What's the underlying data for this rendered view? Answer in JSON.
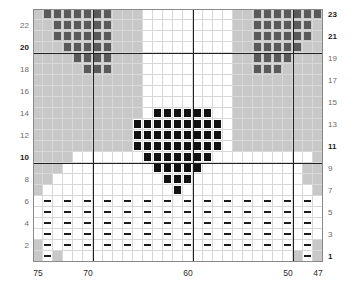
{
  "chart_data": {
    "type": "heatmap",
    "title": "",
    "xlabel": "",
    "ylabel": "",
    "grid": true,
    "columns": 29,
    "rows": 23,
    "x_tick_labels": [
      "75",
      "70",
      "60",
      "50",
      "47"
    ],
    "x_tick_columns": [
      0,
      5,
      15,
      25,
      28
    ],
    "x_range": [
      75,
      47
    ],
    "x_direction": "descending",
    "y_left_tick_labels": [
      "22",
      "20",
      "18",
      "16",
      "14",
      "12",
      "10",
      "8",
      "6",
      "4",
      "2"
    ],
    "y_right_tick_labels": [
      "23",
      "21",
      "19",
      "17",
      "15",
      "13",
      "11",
      "9",
      "7",
      "5",
      "3",
      "1"
    ],
    "y_range": [
      1,
      23
    ],
    "legend": [],
    "symbols": [
      {
        "key": "gray",
        "name": "dark-gray-square",
        "color": "#5a5a5a"
      },
      {
        "key": "black",
        "name": "black-square",
        "color": "#111111"
      },
      {
        "key": "dash",
        "name": "horizontal-dash",
        "color": "#1a1a1a"
      },
      {
        "key": "bg",
        "name": "shaded-background",
        "color": "#c8c8c8"
      },
      {
        "key": "white",
        "name": "empty-cell",
        "color": "#ffffff"
      }
    ],
    "emphasis_lines": {
      "vertical_columns": [
        5,
        15,
        25
      ],
      "horizontal_rows_from_top": [
        3,
        13
      ],
      "color": "#202020"
    },
    "matrix": [
      "bggggggg.bbb.................bbggggggg.b",
      "bggggggg.bbb.................bbggggggg.b",
      "bggggggg.bbb.................bbggggggg.b",
      "bbggggg..bbb.................bbggggggg.b"
    ],
    "cell_rows": [
      [
        "bg",
        "gray",
        "gray",
        "gray",
        "gray",
        "gray",
        "gray",
        "gray",
        "bg",
        "bg",
        "bg",
        "white",
        "white",
        "white",
        "white",
        "white",
        "white",
        "white",
        "white",
        "white",
        "bg",
        "bg",
        "gray",
        "gray",
        "gray",
        "gray",
        "gray",
        "gray",
        "gray"
      ],
      [
        "bg",
        "bg",
        "gray",
        "gray",
        "gray",
        "gray",
        "gray",
        "gray",
        "bg",
        "bg",
        "bg",
        "white",
        "white",
        "white",
        "white",
        "white",
        "white",
        "white",
        "white",
        "white",
        "bg",
        "bg",
        "gray",
        "gray",
        "gray",
        "gray",
        "gray",
        "gray",
        "bg"
      ],
      [
        "bg",
        "bg",
        "gray",
        "gray",
        "gray",
        "gray",
        "gray",
        "gray",
        "bg",
        "bg",
        "bg",
        "white",
        "white",
        "white",
        "white",
        "white",
        "white",
        "white",
        "white",
        "white",
        "bg",
        "bg",
        "gray",
        "gray",
        "gray",
        "gray",
        "gray",
        "gray",
        "bg"
      ],
      [
        "bg",
        "bg",
        "bg",
        "gray",
        "gray",
        "gray",
        "gray",
        "gray",
        "bg",
        "bg",
        "bg",
        "white",
        "white",
        "white",
        "white",
        "white",
        "white",
        "white",
        "white",
        "white",
        "bg",
        "bg",
        "gray",
        "gray",
        "gray",
        "gray",
        "gray",
        "bg",
        "bg"
      ],
      [
        "bg",
        "bg",
        "bg",
        "bg",
        "gray",
        "gray",
        "gray",
        "gray",
        "bg",
        "bg",
        "bg",
        "white",
        "white",
        "white",
        "white",
        "white",
        "white",
        "white",
        "white",
        "white",
        "bg",
        "bg",
        "gray",
        "gray",
        "gray",
        "gray",
        "bg",
        "bg",
        "bg"
      ],
      [
        "bg",
        "bg",
        "bg",
        "bg",
        "bg",
        "gray",
        "gray",
        "gray",
        "bg",
        "bg",
        "bg",
        "white",
        "white",
        "white",
        "white",
        "white",
        "white",
        "white",
        "white",
        "white",
        "bg",
        "bg",
        "gray",
        "gray",
        "gray",
        "bg",
        "bg",
        "bg",
        "bg"
      ],
      [
        "bg",
        "bg",
        "bg",
        "bg",
        "bg",
        "bg",
        "bg",
        "bg",
        "bg",
        "bg",
        "bg",
        "white",
        "white",
        "white",
        "white",
        "white",
        "white",
        "white",
        "white",
        "white",
        "bg",
        "bg",
        "bg",
        "bg",
        "bg",
        "bg",
        "bg",
        "bg",
        "bg"
      ],
      [
        "bg",
        "bg",
        "bg",
        "bg",
        "bg",
        "bg",
        "bg",
        "bg",
        "bg",
        "bg",
        "bg",
        "white",
        "white",
        "white",
        "white",
        "white",
        "white",
        "white",
        "white",
        "white",
        "bg",
        "bg",
        "bg",
        "bg",
        "bg",
        "bg",
        "bg",
        "bg",
        "bg"
      ],
      [
        "bg",
        "bg",
        "bg",
        "bg",
        "bg",
        "bg",
        "bg",
        "bg",
        "bg",
        "bg",
        "bg",
        "white",
        "white",
        "white",
        "white",
        "white",
        "white",
        "white",
        "white",
        "white",
        "bg",
        "bg",
        "bg",
        "bg",
        "bg",
        "bg",
        "bg",
        "bg",
        "bg"
      ],
      [
        "bg",
        "bg",
        "bg",
        "bg",
        "bg",
        "bg",
        "bg",
        "bg",
        "bg",
        "bg",
        "bg",
        "white",
        "black",
        "black",
        "black",
        "black",
        "black",
        "black",
        "white",
        "white",
        "bg",
        "bg",
        "bg",
        "bg",
        "bg",
        "bg",
        "bg",
        "bg",
        "bg"
      ],
      [
        "bg",
        "bg",
        "bg",
        "bg",
        "bg",
        "bg",
        "bg",
        "bg",
        "bg",
        "bg",
        "black",
        "black",
        "black",
        "black",
        "black",
        "black",
        "black",
        "black",
        "black",
        "white",
        "bg",
        "bg",
        "bg",
        "bg",
        "bg",
        "bg",
        "bg",
        "bg",
        "bg"
      ],
      [
        "bg",
        "bg",
        "bg",
        "bg",
        "bg",
        "bg",
        "bg",
        "bg",
        "bg",
        "bg",
        "black",
        "black",
        "black",
        "black",
        "black",
        "black",
        "black",
        "black",
        "black",
        "white",
        "bg",
        "bg",
        "bg",
        "bg",
        "bg",
        "bg",
        "bg",
        "bg",
        "bg"
      ],
      [
        "bg",
        "bg",
        "bg",
        "bg",
        "bg",
        "bg",
        "bg",
        "bg",
        "bg",
        "bg",
        "black",
        "black",
        "black",
        "black",
        "black",
        "black",
        "black",
        "black",
        "black",
        "white",
        "bg",
        "bg",
        "bg",
        "bg",
        "bg",
        "bg",
        "bg",
        "bg",
        "bg"
      ],
      [
        "bg",
        "bg",
        "bg",
        "bg",
        "white",
        "white",
        "white",
        "white",
        "white",
        "white",
        "white",
        "black",
        "black",
        "black",
        "black",
        "black",
        "black",
        "black",
        "white",
        "white",
        "white",
        "white",
        "white",
        "white",
        "white",
        "white",
        "white",
        "white",
        "bg"
      ],
      [
        "bg",
        "bg",
        "bg",
        "white",
        "white",
        "white",
        "white",
        "white",
        "white",
        "white",
        "white",
        "white",
        "black",
        "black",
        "black",
        "black",
        "black",
        "white",
        "white",
        "white",
        "white",
        "white",
        "white",
        "white",
        "white",
        "white",
        "white",
        "bg",
        "bg"
      ],
      [
        "bg",
        "bg",
        "white",
        "white",
        "white",
        "white",
        "white",
        "white",
        "white",
        "white",
        "white",
        "white",
        "white",
        "black",
        "black",
        "black",
        "white",
        "white",
        "white",
        "white",
        "white",
        "white",
        "white",
        "white",
        "white",
        "white",
        "white",
        "bg",
        "bg"
      ],
      [
        "bg",
        "white",
        "white",
        "white",
        "white",
        "white",
        "white",
        "white",
        "white",
        "white",
        "white",
        "white",
        "white",
        "white",
        "black",
        "white",
        "white",
        "white",
        "white",
        "white",
        "white",
        "white",
        "white",
        "white",
        "white",
        "white",
        "white",
        "white",
        "bg"
      ],
      [
        "white",
        "dash",
        "white",
        "dash",
        "white",
        "dash",
        "white",
        "dash",
        "white",
        "dash",
        "white",
        "dash",
        "white",
        "dash",
        "white",
        "dash",
        "white",
        "dash",
        "white",
        "dash",
        "white",
        "dash",
        "white",
        "dash",
        "white",
        "dash",
        "white",
        "dash",
        "white"
      ],
      [
        "white",
        "dash",
        "white",
        "dash",
        "white",
        "dash",
        "white",
        "dash",
        "white",
        "dash",
        "white",
        "dash",
        "white",
        "dash",
        "white",
        "dash",
        "white",
        "dash",
        "white",
        "dash",
        "white",
        "dash",
        "white",
        "dash",
        "white",
        "dash",
        "white",
        "dash",
        "white"
      ],
      [
        "white",
        "dash",
        "white",
        "dash",
        "white",
        "dash",
        "white",
        "dash",
        "white",
        "dash",
        "white",
        "dash",
        "white",
        "dash",
        "white",
        "dash",
        "white",
        "dash",
        "white",
        "dash",
        "white",
        "dash",
        "white",
        "dash",
        "white",
        "dash",
        "white",
        "dash",
        "white"
      ],
      [
        "white",
        "dash",
        "white",
        "dash",
        "white",
        "dash",
        "white",
        "dash",
        "white",
        "dash",
        "white",
        "dash",
        "white",
        "dash",
        "white",
        "dash",
        "white",
        "dash",
        "white",
        "dash",
        "white",
        "dash",
        "white",
        "dash",
        "white",
        "dash",
        "white",
        "dash",
        "white"
      ],
      [
        "bg",
        "dash",
        "white",
        "dash",
        "white",
        "dash",
        "white",
        "dash",
        "white",
        "dash",
        "white",
        "dash",
        "white",
        "dash",
        "white",
        "dash",
        "white",
        "dash",
        "white",
        "dash",
        "white",
        "dash",
        "white",
        "dash",
        "white",
        "dash",
        "white",
        "dash",
        "bg"
      ],
      [
        "bg",
        "dash",
        "bg",
        "white",
        "white",
        "white",
        "white",
        "white",
        "white",
        "white",
        "white",
        "white",
        "white",
        "white",
        "white",
        "white",
        "white",
        "white",
        "white",
        "white",
        "white",
        "white",
        "white",
        "white",
        "white",
        "white",
        "bg",
        "dash",
        "bg"
      ]
    ]
  },
  "axes": {
    "left_ticks": [
      {
        "label": "22",
        "row_from_top": 1,
        "bold": false
      },
      {
        "label": "20",
        "row_from_top": 3,
        "bold": true
      },
      {
        "label": "18",
        "row_from_top": 5,
        "bold": false
      },
      {
        "label": "16",
        "row_from_top": 7,
        "bold": false
      },
      {
        "label": "14",
        "row_from_top": 9,
        "bold": false
      },
      {
        "label": "12",
        "row_from_top": 11,
        "bold": false
      },
      {
        "label": "10",
        "row_from_top": 13,
        "bold": true
      },
      {
        "label": "8",
        "row_from_top": 15,
        "bold": false
      },
      {
        "label": "6",
        "row_from_top": 17,
        "bold": false
      },
      {
        "label": "4",
        "row_from_top": 19,
        "bold": false
      },
      {
        "label": "2",
        "row_from_top": 21,
        "bold": false
      }
    ],
    "right_ticks": [
      {
        "label": "23",
        "row_from_top": 0,
        "bold": true
      },
      {
        "label": "21",
        "row_from_top": 2,
        "bold": true
      },
      {
        "label": "19",
        "row_from_top": 4,
        "bold": false
      },
      {
        "label": "17",
        "row_from_top": 6,
        "bold": false
      },
      {
        "label": "15",
        "row_from_top": 8,
        "bold": false
      },
      {
        "label": "13",
        "row_from_top": 10,
        "bold": false
      },
      {
        "label": "11",
        "row_from_top": 12,
        "bold": true
      },
      {
        "label": "9",
        "row_from_top": 14,
        "bold": false
      },
      {
        "label": "7",
        "row_from_top": 16,
        "bold": false
      },
      {
        "label": "5",
        "row_from_top": 18,
        "bold": false
      },
      {
        "label": "3",
        "row_from_top": 20,
        "bold": false
      },
      {
        "label": "1",
        "row_from_top": 22,
        "bold": true
      }
    ],
    "bottom_ticks": [
      {
        "label": "75",
        "col": 0
      },
      {
        "label": "70",
        "col": 5
      },
      {
        "label": "60",
        "col": 15
      },
      {
        "label": "50",
        "col": 25
      },
      {
        "label": "47",
        "col": 28
      }
    ]
  }
}
